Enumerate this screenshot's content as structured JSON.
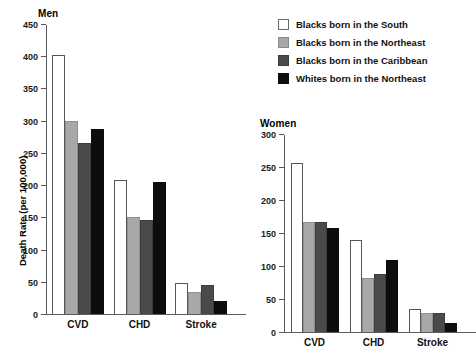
{
  "chart_data": [
    {
      "type": "bar",
      "title": "Men",
      "xlabel": "",
      "ylabel": "Death Rate (per 100,000)",
      "categories": [
        "CVD",
        "CHD",
        "Stroke"
      ],
      "ylim": [
        0,
        450
      ],
      "yticks": [
        0,
        50,
        100,
        150,
        200,
        250,
        300,
        350,
        400,
        450
      ],
      "grid": false,
      "legend_position": "top-right",
      "series": [
        {
          "name": "Blacks born in the South",
          "color": "#ffffff",
          "values": [
            403,
            209,
            49
          ]
        },
        {
          "name": "Blacks born in the Northeast",
          "color": "#a8a8a8",
          "values": [
            300,
            151,
            35
          ]
        },
        {
          "name": "Blacks born in the Caribbean",
          "color": "#4a4a4a",
          "values": [
            267,
            146,
            45
          ]
        },
        {
          "name": "Whites born in the Northeast",
          "color": "#0d0d0d",
          "values": [
            288,
            205,
            20
          ]
        }
      ]
    },
    {
      "type": "bar",
      "title": "Women",
      "xlabel": "",
      "ylabel": "",
      "categories": [
        "CVD",
        "CHD",
        "Stroke"
      ],
      "ylim": [
        0,
        300
      ],
      "yticks": [
        0,
        50,
        100,
        150,
        200,
        250,
        300
      ],
      "grid": false,
      "legend_position": "top-right",
      "series": [
        {
          "name": "Blacks born in the South",
          "color": "#ffffff",
          "values": [
            258,
            140,
            35
          ]
        },
        {
          "name": "Blacks born in the Northeast",
          "color": "#a8a8a8",
          "values": [
            167,
            83,
            29
          ]
        },
        {
          "name": "Blacks born in the Caribbean",
          "color": "#4a4a4a",
          "values": [
            167,
            89,
            29
          ]
        },
        {
          "name": "Whites born in the Northeast",
          "color": "#0d0d0d",
          "values": [
            158,
            110,
            14
          ]
        }
      ]
    }
  ],
  "legend": {
    "items": [
      {
        "label": "Blacks born in the South",
        "color": "#ffffff"
      },
      {
        "label": "Blacks born in the Northeast",
        "color": "#a8a8a8"
      },
      {
        "label": "Blacks born in the Caribbean",
        "color": "#4a4a4a"
      },
      {
        "label": "Whites born in the Northeast",
        "color": "#0d0d0d"
      }
    ]
  }
}
